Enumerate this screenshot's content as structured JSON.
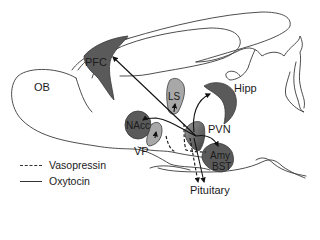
{
  "figure": {
    "type": "sagittal-brain-schematic",
    "colors": {
      "dark_region": "#5a5a5a",
      "light_region": "#a8a8a8",
      "outline": "#3a3a3a",
      "background": "#ffffff"
    }
  },
  "regions": {
    "ob": "OB",
    "pfc": "PFC",
    "ls": "LS",
    "hipp": "Hipp",
    "nacc": "NAcc",
    "vp": "VP",
    "pvn": "PVN",
    "amy": "Amy",
    "bst": "BST",
    "pituitary": "Pituitary"
  },
  "legend": {
    "items": [
      {
        "style": "dashed",
        "label": "Vasopressin"
      },
      {
        "style": "solid",
        "label": "Oxytocin"
      }
    ]
  }
}
